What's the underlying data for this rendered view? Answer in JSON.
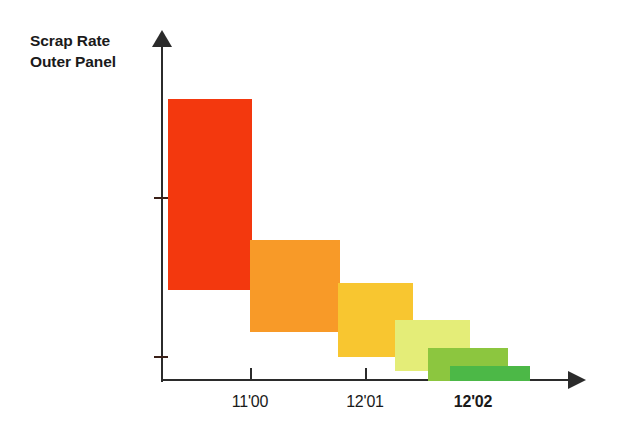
{
  "chart_data": {
    "type": "bar",
    "title": "Scrap Rate Outer Panel",
    "title_line1": "Scrap Rate",
    "title_line2": "Outer Panel",
    "xlabel": "",
    "ylabel": "Scrap Rate Outer Panel",
    "grid": false,
    "legend": "none",
    "axis_style": "arrow-axes",
    "note": "Descending staircase of overlapping colored blocks showing scrap rate reduction over time; bars are ranges (floating blocks) rather than baseline bars.",
    "categories": [
      "11'00",
      "12'01",
      "12'02"
    ],
    "tick_labels": [
      "11'00",
      "12'01",
      "12'02"
    ],
    "tick_label_bold": [
      false,
      false,
      true
    ],
    "tick_x_px": [
      250,
      365,
      473
    ],
    "y_tick_y_px": [
      197,
      356
    ],
    "axis": {
      "y_axis_x_px": 162,
      "baseline_y_px": 381,
      "y_top_px": 32,
      "x_end_px": 585
    },
    "series": [
      {
        "name": "Step 1",
        "color": "#f3380e",
        "color_name": "red",
        "x_start_px": 168,
        "x_end_px": 252,
        "top_px": 99,
        "bottom_px": 290,
        "value_top": 100,
        "value_bottom": 68
      },
      {
        "name": "Step 2",
        "color": "#f89a28",
        "color_name": "orange",
        "x_start_px": 250,
        "x_end_px": 340,
        "top_px": 240,
        "bottom_px": 332,
        "value_top": 50,
        "value_bottom": 35
      },
      {
        "name": "Step 3",
        "color": "#f8c630",
        "color_name": "gold",
        "x_start_px": 338,
        "x_end_px": 413,
        "top_px": 283,
        "bottom_px": 357,
        "value_top": 33,
        "value_bottom": 21
      },
      {
        "name": "Step 4",
        "color": "#e4ed78",
        "color_name": "pale-yellow",
        "x_start_px": 395,
        "x_end_px": 470,
        "top_px": 320,
        "bottom_px": 371,
        "value_top": 21,
        "value_bottom": 12
      },
      {
        "name": "Step 5",
        "color": "#8cc63f",
        "color_name": "light-green",
        "x_start_px": 428,
        "x_end_px": 508,
        "top_px": 348,
        "bottom_px": 381,
        "value_top": 16,
        "value_bottom": 10
      },
      {
        "name": "Step 6",
        "color": "#4cb847",
        "color_name": "dark-green",
        "x_start_px": 450,
        "x_end_px": 530,
        "top_px": 366,
        "bottom_px": 381,
        "value_top": 13,
        "value_bottom": 10
      }
    ],
    "colors": {
      "axis": "#2b2b2b",
      "text": "#1a1a1a",
      "background": "#ffffff"
    }
  }
}
